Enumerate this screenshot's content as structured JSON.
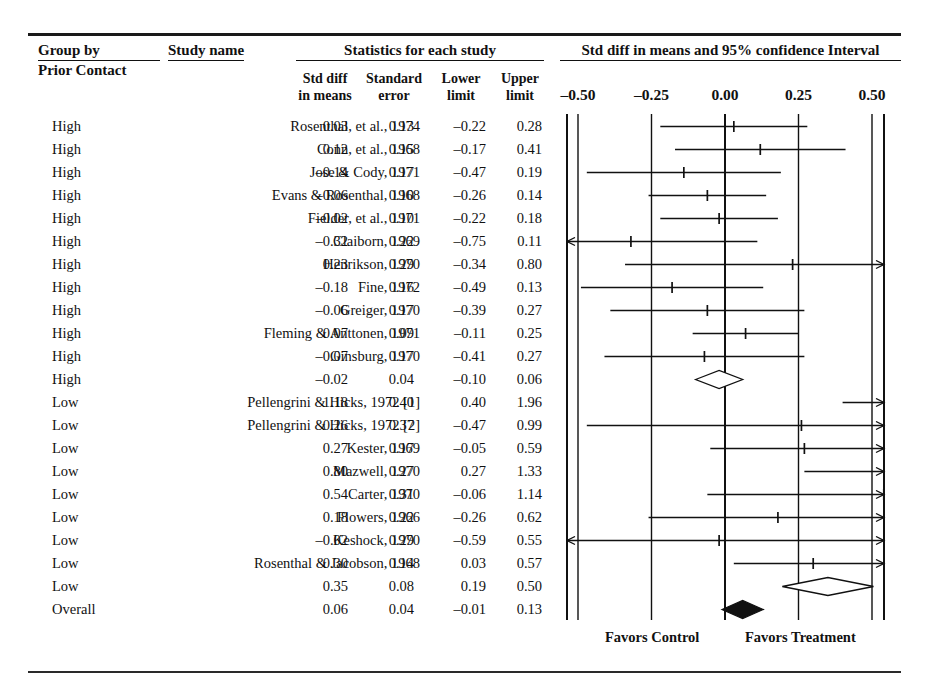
{
  "headers": {
    "group_by": "Group by",
    "prior_contact": "Prior Contact",
    "study_name": "Study name",
    "statistics": "Statistics for each study",
    "plot_title": "Std diff in means and 95% confidence Interval",
    "std_diff_l1": "Std diff",
    "std_diff_l2": "in means",
    "std_err_l1": "Standard",
    "std_err_l2": "error",
    "lower_l1": "Lower",
    "lower_l2": "limit",
    "upper_l1": "Upper",
    "upper_l2": "limit"
  },
  "footer": {
    "favors_control": "Favors Control",
    "favors_treatment": "Favors Treatment"
  },
  "chart_data": {
    "type": "forest",
    "title": "Std diff in means and 95% confidence Interval",
    "xlabel": "",
    "ylabel": "",
    "xlim": [
      -0.62,
      0.62
    ],
    "axis_ticks": [
      -0.5,
      -0.25,
      0.0,
      0.25,
      0.5
    ],
    "axis_tick_labels": [
      "–0.50",
      "–0.25",
      "0.00",
      "0.25",
      "0.50"
    ],
    "grid": true,
    "null_line": 0.0,
    "legend_left": "Favors Control",
    "legend_right": "Favors Treatment",
    "columns": [
      "Group by Prior Contact",
      "Study name",
      "Std diff in means",
      "Standard error",
      "Lower limit",
      "Upper limit"
    ],
    "rows": [
      {
        "group": "High",
        "study": "Rosenthal, et al., 1974",
        "std_diff": 0.03,
        "std_err": 0.13,
        "lower": -0.22,
        "upper": 0.28,
        "std_diff_txt": "0.03",
        "std_err_txt": "0.13",
        "lower_txt": "–0.22",
        "upper_txt": "0.28",
        "marker": "tick"
      },
      {
        "group": "High",
        "study": "Conn, et al., 1968",
        "std_diff": 0.12,
        "std_err": 0.15,
        "lower": -0.17,
        "upper": 0.41,
        "std_diff_txt": "0.12",
        "std_err_txt": "0.15",
        "lower_txt": "–0.17",
        "upper_txt": "0.41",
        "marker": "tick"
      },
      {
        "group": "High",
        "study": "Jose & Cody, 1971",
        "std_diff": -0.14,
        "std_err": 0.17,
        "lower": -0.47,
        "upper": 0.19,
        "std_diff_txt": "–0.14",
        "std_err_txt": "0.17",
        "lower_txt": "–0.47",
        "upper_txt": "0.19",
        "marker": "tick"
      },
      {
        "group": "High",
        "study": "Evans & Rosenthal, 1968",
        "std_diff": -0.06,
        "std_err": 0.1,
        "lower": -0.26,
        "upper": 0.14,
        "std_diff_txt": "–0.06",
        "std_err_txt": "0.10",
        "lower_txt": "–0.26",
        "upper_txt": "0.14",
        "marker": "tick"
      },
      {
        "group": "High",
        "study": "Fielder, et al., 1971",
        "std_diff": -0.02,
        "std_err": 0.1,
        "lower": -0.22,
        "upper": 0.18,
        "std_diff_txt": "–0.02",
        "std_err_txt": "0.10",
        "lower_txt": "–0.22",
        "upper_txt": "0.18",
        "marker": "tick"
      },
      {
        "group": "High",
        "study": "Claiborn, 1969",
        "std_diff": -0.32,
        "std_err": 0.22,
        "lower": -0.75,
        "upper": 0.11,
        "std_diff_txt": "–0.32",
        "std_err_txt": "0.22",
        "lower_txt": "–0.75",
        "upper_txt": "0.11",
        "marker": "tick"
      },
      {
        "group": "High",
        "study": "Henrikson, 1970",
        "std_diff": 0.23,
        "std_err": 0.29,
        "lower": -0.34,
        "upper": 0.8,
        "std_diff_txt": "0.23",
        "std_err_txt": "0.29",
        "lower_txt": "–0.34",
        "upper_txt": "0.80",
        "marker": "tick"
      },
      {
        "group": "High",
        "study": "Fine, 1972",
        "std_diff": -0.18,
        "std_err": 0.16,
        "lower": -0.49,
        "upper": 0.13,
        "std_diff_txt": "–0.18",
        "std_err_txt": "0.16",
        "lower_txt": "–0.49",
        "upper_txt": "0.13",
        "marker": "tick"
      },
      {
        "group": "High",
        "study": "Greiger, 1970",
        "std_diff": -0.06,
        "std_err": 0.17,
        "lower": -0.39,
        "upper": 0.27,
        "std_diff_txt": "–0.06",
        "std_err_txt": "0.17",
        "lower_txt": "–0.39",
        "upper_txt": "0.27",
        "marker": "tick"
      },
      {
        "group": "High",
        "study": "Fleming & Anttonen, 1971",
        "std_diff": 0.07,
        "std_err": 0.09,
        "lower": -0.11,
        "upper": 0.25,
        "std_diff_txt": "0.07",
        "std_err_txt": "0.09",
        "lower_txt": "–0.11",
        "upper_txt": "0.25",
        "marker": "tick"
      },
      {
        "group": "High",
        "study": "Ginsburg, 1970",
        "std_diff": -0.07,
        "std_err": 0.17,
        "lower": -0.41,
        "upper": 0.27,
        "std_diff_txt": "–0.07",
        "std_err_txt": "0.17",
        "lower_txt": "–0.41",
        "upper_txt": "0.27",
        "marker": "tick"
      },
      {
        "group": "High",
        "study": "",
        "std_diff": -0.02,
        "std_err": 0.04,
        "lower": -0.1,
        "upper": 0.06,
        "std_diff_txt": "–0.02",
        "std_err_txt": "0.04",
        "lower_txt": "–0.10",
        "upper_txt": "0.06",
        "marker": "diamond-open"
      },
      {
        "group": "Low",
        "study": "Pellengrini & Hicks, 1972 [1]",
        "std_diff": 1.18,
        "std_err": 0.4,
        "lower": 0.4,
        "upper": 1.96,
        "std_diff_txt": "1.18",
        "std_err_txt": "0.40",
        "lower_txt": "0.40",
        "upper_txt": "1.96",
        "marker": "tick"
      },
      {
        "group": "Low",
        "study": "Pellengrini & Hicks, 1972 [2]",
        "std_diff": 0.26,
        "std_err": 0.37,
        "lower": -0.47,
        "upper": 0.99,
        "std_diff_txt": "0.26",
        "std_err_txt": "0.37",
        "lower_txt": "–0.47",
        "upper_txt": "0.99",
        "marker": "tick"
      },
      {
        "group": "Low",
        "study": "Kester, 1969",
        "std_diff": 0.27,
        "std_err": 0.17,
        "lower": -0.05,
        "upper": 0.59,
        "std_diff_txt": "0.27",
        "std_err_txt": "0.17",
        "lower_txt": "–0.05",
        "upper_txt": "0.59",
        "marker": "tick"
      },
      {
        "group": "Low",
        "study": "Mazwell, 1970",
        "std_diff": 0.8,
        "std_err": 0.27,
        "lower": 0.27,
        "upper": 1.33,
        "std_diff_txt": "0.80",
        "std_err_txt": "0.27",
        "lower_txt": "0.27",
        "upper_txt": "1.33",
        "marker": "tick"
      },
      {
        "group": "Low",
        "study": "Carter, 1970",
        "std_diff": 0.54,
        "std_err": 0.31,
        "lower": -0.06,
        "upper": 1.14,
        "std_diff_txt": "0.54",
        "std_err_txt": "0.31",
        "lower_txt": "–0.06",
        "upper_txt": "1.14",
        "marker": "tick"
      },
      {
        "group": "Low",
        "study": "Flowers, 1966",
        "std_diff": 0.18,
        "std_err": 0.22,
        "lower": -0.26,
        "upper": 0.62,
        "std_diff_txt": "0.18",
        "std_err_txt": "0.22",
        "lower_txt": "–0.26",
        "upper_txt": "0.62",
        "marker": "tick"
      },
      {
        "group": "Low",
        "study": "Keshock, 1970",
        "std_diff": -0.02,
        "std_err": 0.29,
        "lower": -0.59,
        "upper": 0.55,
        "std_diff_txt": "–0.02",
        "std_err_txt": "0.29",
        "lower_txt": "–0.59",
        "upper_txt": "0.55",
        "marker": "tick"
      },
      {
        "group": "Low",
        "study": "Rosenthal & Jacobson, 1968",
        "std_diff": 0.3,
        "std_err": 0.14,
        "lower": 0.03,
        "upper": 0.57,
        "std_diff_txt": "0.30",
        "std_err_txt": "0.14",
        "lower_txt": "0.03",
        "upper_txt": "0.57",
        "marker": "tick"
      },
      {
        "group": "Low",
        "study": "",
        "std_diff": 0.35,
        "std_err": 0.08,
        "lower": 0.19,
        "upper": 0.5,
        "std_diff_txt": "0.35",
        "std_err_txt": "0.08",
        "lower_txt": "0.19",
        "upper_txt": "0.50",
        "marker": "diamond-open"
      },
      {
        "group": "Overall",
        "study": "",
        "std_diff": 0.06,
        "std_err": 0.04,
        "lower": -0.01,
        "upper": 0.13,
        "std_diff_txt": "0.06",
        "std_err_txt": "0.04",
        "lower_txt": "–0.01",
        "upper_txt": "0.13",
        "marker": "diamond-filled"
      }
    ]
  }
}
